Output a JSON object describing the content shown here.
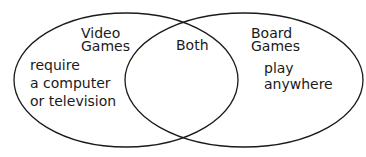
{
  "diagram": {
    "type": "venn",
    "stroke_color": "#1a1a1a",
    "background": "#ffffff",
    "sets": [
      {
        "id": "left",
        "title_line1": "Video",
        "title_line2": "Games",
        "items": [
          "require",
          "a computer",
          "or television"
        ]
      },
      {
        "id": "right",
        "title_line1": "Board",
        "title_line2": "Games",
        "items": [
          "play",
          "anywhere"
        ]
      }
    ],
    "intersection": {
      "label": "Both",
      "items": []
    }
  }
}
